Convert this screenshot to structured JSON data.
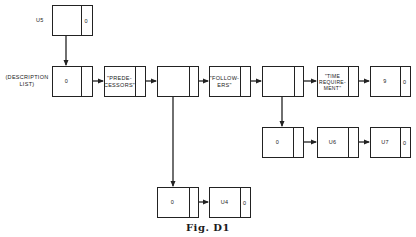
{
  "diagram": {
    "caption": "Fig. D1",
    "side_label": "(DESCRIPTION LIST)",
    "nodes": [
      {
        "id": "u5",
        "main": "",
        "ptr": "0",
        "left_label": "U5"
      },
      {
        "id": "desc",
        "main": "0",
        "ptr": ""
      },
      {
        "id": "pred",
        "main": "\"PREDE-CESSORS\"",
        "ptr": ""
      },
      {
        "id": "n3",
        "main": "",
        "ptr": ""
      },
      {
        "id": "foll",
        "main": "\"FOLLOW-ERS\"",
        "ptr": ""
      },
      {
        "id": "n5",
        "main": "",
        "ptr": ""
      },
      {
        "id": "time",
        "main": "\"TIME REQUIRE-MENT\"",
        "ptr": ""
      },
      {
        "id": "nine",
        "main": "9",
        "ptr": "0"
      },
      {
        "id": "r2a",
        "main": "0",
        "ptr": ""
      },
      {
        "id": "u6",
        "main": "U6",
        "ptr": ""
      },
      {
        "id": "u7",
        "main": "U7",
        "ptr": "0"
      },
      {
        "id": "r3a",
        "main": "0",
        "ptr": ""
      },
      {
        "id": "u4",
        "main": "U4",
        "ptr": "0"
      }
    ],
    "labels": {
      "u5": "U5",
      "desc_line1": "(DESCRIPTION",
      "desc_line2": "LIST)",
      "desc_main": "0",
      "u5_ptr": "0",
      "pred_l1": "\"PREDE-",
      "pred_l2": "CESSORS\"",
      "foll_l1": "\"FOLLOW-",
      "foll_l2": "ERS\"",
      "time_l1": "\"TIME",
      "time_l2": "REQUIRE-",
      "time_l3": "MENT\"",
      "nine_main": "9",
      "nine_ptr": "0",
      "r2a_main": "0",
      "u6_main": "U6",
      "u7_main": "U7",
      "u7_ptr": "0",
      "r3a_main": "0",
      "u4_main": "U4",
      "u4_ptr": "0"
    },
    "edges": [
      [
        "u5",
        "desc"
      ],
      [
        "desc",
        "pred"
      ],
      [
        "pred",
        "n3"
      ],
      [
        "n3",
        "foll"
      ],
      [
        "foll",
        "n5"
      ],
      [
        "n5",
        "time"
      ],
      [
        "time",
        "nine"
      ],
      [
        "n5",
        "r2a"
      ],
      [
        "r2a",
        "u6"
      ],
      [
        "u6",
        "u7"
      ],
      [
        "n3",
        "r3a"
      ],
      [
        "r3a",
        "u4"
      ]
    ]
  }
}
